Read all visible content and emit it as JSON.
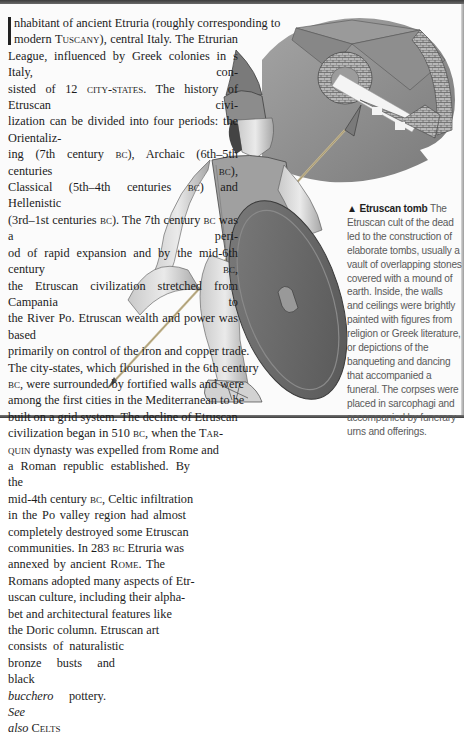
{
  "article": {
    "lines": [
      {
        "parts": [
          {
            "t": "nhabitant of ancient Etruria (roughly corresponding to"
          }
        ],
        "dropcap": true
      },
      {
        "parts": [
          {
            "t": "modern "
          },
          {
            "t": "Tuscany",
            "sc": true
          },
          {
            "t": "), central Italy. The Etrurian"
          }
        ],
        "justify": true
      },
      {
        "parts": [
          {
            "t": "League, influenced by Greek colonies in "
          },
          {
            "t": "s",
            "sc": true
          },
          {
            "t": " Italy, con-"
          }
        ],
        "justify": true
      },
      {
        "parts": [
          {
            "t": "sisted of 12 "
          },
          {
            "t": "city-states",
            "sc": true
          },
          {
            "t": ". The history of Etruscan civi-"
          }
        ],
        "justify": true
      },
      {
        "parts": [
          {
            "t": "lization can be divided into four periods: the Orientaliz-"
          }
        ],
        "justify": true
      },
      {
        "parts": [
          {
            "t": "ing (7th century "
          },
          {
            "t": "bc",
            "sc": true
          },
          {
            "t": "), Archaic (6th–5th centuries "
          },
          {
            "t": "bc",
            "sc": true
          },
          {
            "t": "),"
          }
        ],
        "justify": true
      },
      {
        "parts": [
          {
            "t": "Classical (5th–4th centuries "
          },
          {
            "t": "bc",
            "sc": true
          },
          {
            "t": ") and Hellenistic"
          }
        ],
        "justify": true
      },
      {
        "parts": [
          {
            "t": "(3rd–1st centuries "
          },
          {
            "t": "bc",
            "sc": true
          },
          {
            "t": "). The 7th century "
          },
          {
            "t": "bc",
            "sc": true
          },
          {
            "t": " was a peri-"
          }
        ],
        "justify": true
      },
      {
        "parts": [
          {
            "t": "od of rapid expansion and by the mid-6th century "
          },
          {
            "t": "bc",
            "sc": true
          },
          {
            "t": ","
          }
        ],
        "justify": true
      },
      {
        "parts": [
          {
            "t": "the Etruscan civilization stretched from Campania to"
          }
        ],
        "justify": true
      },
      {
        "parts": [
          {
            "t": "the River Po. Etruscan wealth and power was based"
          }
        ],
        "justify": true
      },
      {
        "parts": [
          {
            "t": "primarily on control of the iron and copper trade."
          }
        ]
      },
      {
        "parts": [
          {
            "t": "The city-states, which flourished in the 6th century"
          }
        ]
      },
      {
        "parts": [
          {
            "t": "bc",
            "sc": true
          },
          {
            "t": ", were surrounded by fortified walls and were"
          }
        ]
      },
      {
        "parts": [
          {
            "t": "among the first cities in the Mediterranean to be"
          }
        ]
      },
      {
        "parts": [
          {
            "t": "built on a grid system. The decline of Etruscan"
          }
        ]
      },
      {
        "parts": [
          {
            "t": "civilization began in 510 "
          },
          {
            "t": "bc",
            "sc": true
          },
          {
            "t": ", when the "
          },
          {
            "t": "Tar-",
            "sc": true
          }
        ]
      },
      {
        "parts": [
          {
            "t": "quin",
            "sc": true
          },
          {
            "t": " dynasty was expelled from Rome and"
          }
        ]
      },
      {
        "parts": [
          {
            "t": "a Roman republic established. By the"
          }
        ],
        "justify": true,
        "width": 182
      },
      {
        "parts": [
          {
            "t": "mid-4th century "
          },
          {
            "t": "bc",
            "sc": true
          },
          {
            "t": ", Celtic infiltration"
          }
        ]
      },
      {
        "parts": [
          {
            "t": "in the Po valley region had almost"
          }
        ],
        "justify": true,
        "width": 178
      },
      {
        "parts": [
          {
            "t": "completely destroyed some Etruscan"
          }
        ]
      },
      {
        "parts": [
          {
            "t": "communities. In 283 "
          },
          {
            "t": "bc",
            "sc": true
          },
          {
            "t": " Etruria was"
          }
        ]
      },
      {
        "parts": [
          {
            "t": "annexed by ancient "
          },
          {
            "t": "Rome",
            "sc": true
          },
          {
            "t": ". The"
          }
        ],
        "justify": true,
        "width": 157
      },
      {
        "parts": [
          {
            "t": "Romans adopted many aspects of Etr-"
          }
        ]
      },
      {
        "parts": [
          {
            "t": "uscan culture, including their alpha-"
          }
        ]
      },
      {
        "parts": [
          {
            "t": "bet and architectural features like"
          }
        ]
      },
      {
        "parts": [
          {
            "t": "the Doric column. Etruscan art"
          }
        ]
      },
      {
        "parts": [
          {
            "t": "consists of naturalistic"
          }
        ],
        "justify": true,
        "width": 116
      },
      {
        "parts": [
          {
            "t": "bronze busts and black"
          }
        ],
        "justify": true,
        "width": 107
      },
      {
        "parts": [
          {
            "t": "bucchero",
            "it": true
          },
          {
            "t": " pottery. "
          },
          {
            "t": "See",
            "it": true
          }
        ],
        "justify": true,
        "width": 98
      },
      {
        "parts": [
          {
            "t": "also",
            "it": true
          },
          {
            "t": " "
          },
          {
            "t": "Celts",
            "sc": true
          }
        ]
      }
    ]
  },
  "caption": {
    "marker": "▲",
    "title": "Etruscan tomb",
    "lines": [
      "The",
      "Etruscan cult of the dead",
      "led to the construction of",
      "elaborate tombs, usually a",
      "vault of overlapping stones",
      "covered with a mound of",
      "earth. Inside, the walls",
      "and ceilings were brightly",
      "painted with figures from",
      "religion or Greek literature,",
      "or depictions of the",
      "banqueting and dancing",
      "that accompanied a",
      "funeral. The corpses were",
      "placed in sarcophagi and",
      "accompanied by funerary",
      "urns and offerings."
    ]
  },
  "illustrations": {
    "tomb": "etruscan-tomb-cutaway",
    "warrior": "etruscan-warrior-with-spear-and-shield"
  },
  "colors": {
    "text": "#1c1c1c",
    "caption": "#5a5a5a",
    "rule": "#3c3c3c",
    "tomb_mound": "#8c8c8c",
    "shield": "#6e6e6e"
  }
}
